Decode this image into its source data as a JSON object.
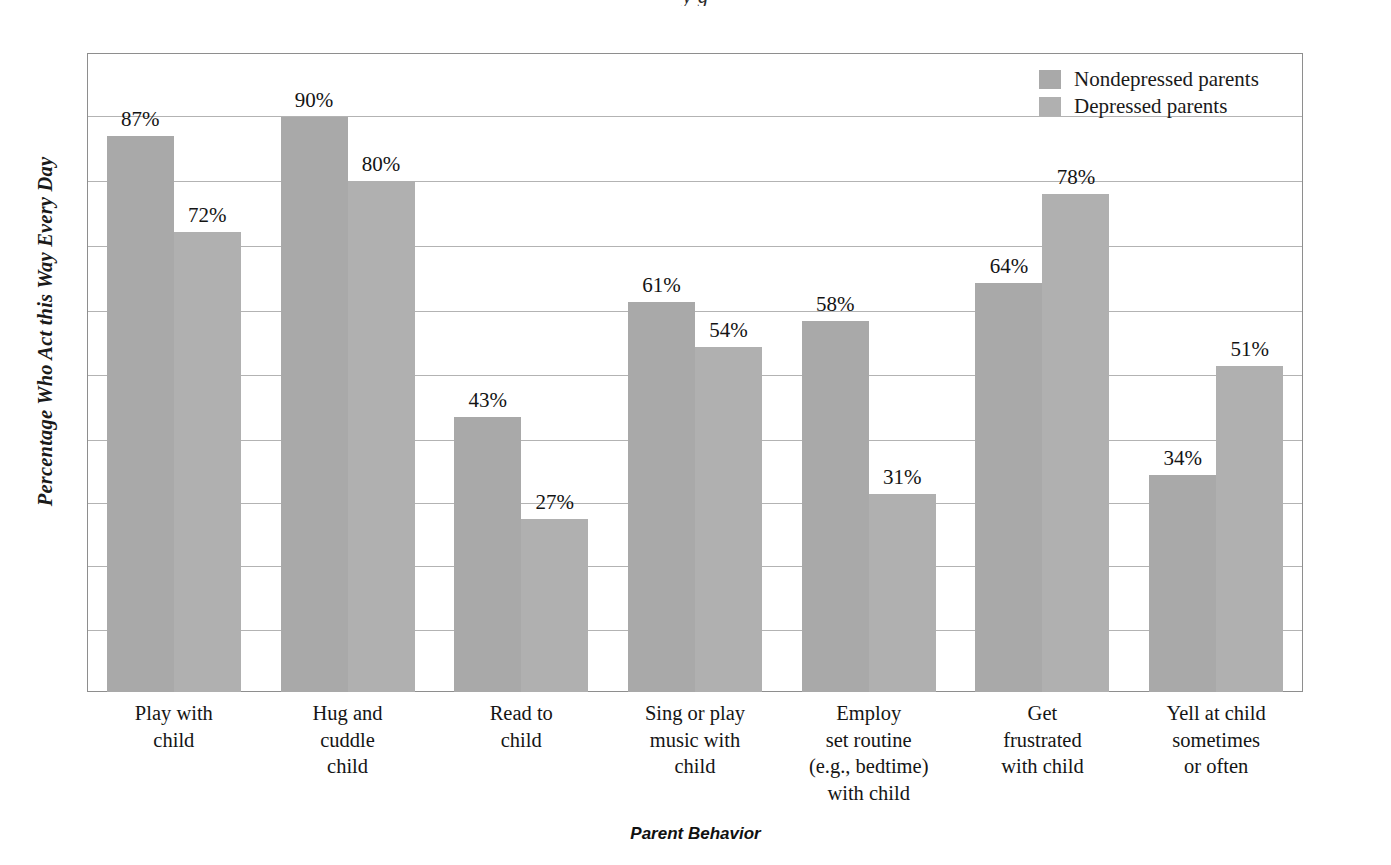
{
  "figure": {
    "x_axis_title": "Parent Behavior",
    "y_axis_title": "Percentage Who Act this Way Every Day",
    "cropped_title_sliver": "y g"
  },
  "legend": {
    "position": "top-right",
    "items": [
      {
        "label": "Nondepressed parents",
        "color": "#a9a9a9"
      },
      {
        "label": "Depressed parents",
        "color": "#b0b0b0"
      }
    ]
  },
  "colors": {
    "series_1": "#a9a9a9",
    "series_2": "#b0b0b0",
    "frame": "#8e8e8e",
    "gridline": "#b3b3b3",
    "text": "#151515"
  },
  "chart_data": {
    "type": "bar",
    "title": "",
    "xlabel": "Parent Behavior",
    "ylabel": "Percentage Who Act this Way Every Day",
    "ylim": [
      0,
      100
    ],
    "grid": true,
    "grid_step": 10,
    "y_tick_labels_shown": false,
    "legend_position": "top-right",
    "categories": [
      "Play with child",
      "Hug and cuddle child",
      "Read to child",
      "Sing or play music with child",
      "Employ set routine (e.g., bedtime) with child",
      "Get frustrated with child",
      "Yell at child sometimes or often"
    ],
    "category_label_lines": [
      [
        "Play with",
        "child"
      ],
      [
        "Hug and",
        "cuddle",
        "child"
      ],
      [
        "Read to",
        "child"
      ],
      [
        "Sing or play",
        "music with",
        "child"
      ],
      [
        "Employ",
        "set routine",
        "(e.g., bedtime)",
        "with child"
      ],
      [
        "Get",
        "frustrated",
        "with child"
      ],
      [
        "Yell at child",
        "sometimes",
        "or often"
      ]
    ],
    "series": [
      {
        "name": "Nondepressed parents",
        "values": [
          87,
          90,
          43,
          61,
          58,
          64,
          34
        ],
        "value_labels": [
          "87%",
          "90%",
          "43%",
          "61%",
          "58%",
          "64%",
          "34%"
        ]
      },
      {
        "name": "Depressed parents",
        "values": [
          72,
          80,
          27,
          54,
          31,
          78,
          51
        ],
        "value_labels": [
          "72%",
          "80%",
          "27%",
          "54%",
          "31%",
          "78%",
          "51%"
        ]
      }
    ]
  }
}
